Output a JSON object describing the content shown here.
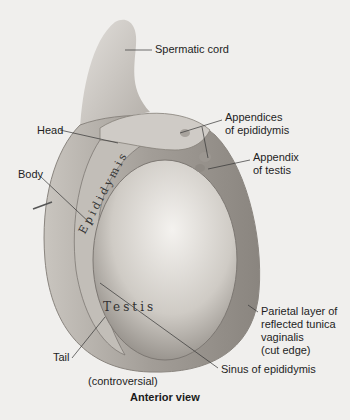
{
  "figure": {
    "view_caption": "Anterior view",
    "background_color": "#f0efed",
    "organ_labels": {
      "testis": "Testis",
      "epididymis": "Epididymis"
    },
    "labels": {
      "spermatic_cord": "Spermatic cord",
      "appendices_line1": "Appendices",
      "appendices_line2": "of epididymis",
      "head": "Head",
      "appendix_line1": "Appendix",
      "appendix_line2": "of testis",
      "body": "Body",
      "parietal_line1": "Parietal layer of",
      "parietal_line2": "reflected tunica",
      "parietal_line3": "vaginalis",
      "parietal_line4": "(cut edge)",
      "tail": "Tail",
      "sinus": "Sinus of epididymis",
      "controversial": "(controversial)"
    }
  }
}
